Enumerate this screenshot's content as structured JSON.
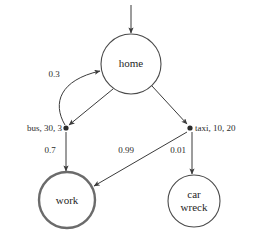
{
  "diagram": {
    "background_color": "#ffffff",
    "stroke_color": "#3b3b3b",
    "text_color": "#2b2b2b",
    "nodes": [
      {
        "id": "home",
        "label": "home",
        "shape": "circle",
        "terminal": false
      },
      {
        "id": "work",
        "label": "work",
        "shape": "circle",
        "terminal": true
      },
      {
        "id": "car_wreck",
        "label_line1": "car",
        "label_line2": "wreck",
        "shape": "circle",
        "terminal": false
      }
    ],
    "actions": [
      {
        "id": "bus",
        "label": "bus, 30, 3",
        "anchor": "right"
      },
      {
        "id": "taxi",
        "label": "taxi, 10, 20",
        "anchor": "left"
      }
    ],
    "edge_labels": {
      "bus_to_home": "0.3",
      "bus_to_work": "0.7",
      "taxi_to_work": "0.99",
      "taxi_to_car_wreck": "0.01"
    },
    "entry_arrow": "start-arrow"
  }
}
